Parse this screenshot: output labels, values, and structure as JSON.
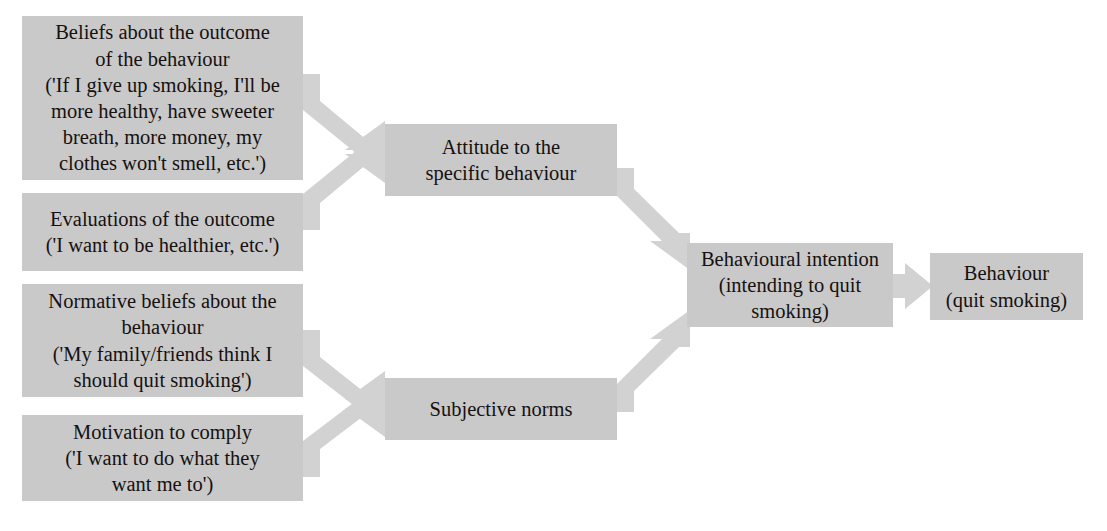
{
  "diagram": {
    "type": "flow-diagram",
    "colors": {
      "box_fill": "#c9c9c9",
      "arrow_fill": "#d2d2d2",
      "text": "#16110f",
      "background": "#ffffff"
    },
    "nodes": [
      {
        "id": "beliefs",
        "label": "Beliefs about the outcome\nof the behaviour\n('If I give up smoking, I'll be\nmore healthy, have sweeter\nbreath, more money, my\nclothes won't smell, etc.')"
      },
      {
        "id": "evaluations",
        "label": "Evaluations of the outcome\n('I want to be healthier, etc.')"
      },
      {
        "id": "normative",
        "label": "Normative beliefs about the\nbehaviour\n('My family/friends think I\nshould quit smoking')"
      },
      {
        "id": "motivation",
        "label": "Motivation to comply\n('I want to do what they\nwant me to')"
      },
      {
        "id": "attitude",
        "label": "Attitude to the\nspecific behaviour"
      },
      {
        "id": "subjective",
        "label": "Subjective norms"
      },
      {
        "id": "intention",
        "label": "Behavioural intention\n(intending to quit\nsmoking)"
      },
      {
        "id": "behaviour",
        "label": "Behaviour\n(quit smoking)"
      }
    ],
    "edges": [
      {
        "id": "beliefs-to-attitude",
        "from": "beliefs",
        "to": "attitude"
      },
      {
        "id": "evaluations-to-attitude",
        "from": "evaluations",
        "to": "attitude"
      },
      {
        "id": "normative-to-subjective",
        "from": "normative",
        "to": "subjective"
      },
      {
        "id": "motivation-to-subjective",
        "from": "motivation",
        "to": "subjective"
      },
      {
        "id": "attitude-to-intention",
        "from": "attitude",
        "to": "intention"
      },
      {
        "id": "subjective-to-intention",
        "from": "subjective",
        "to": "intention"
      },
      {
        "id": "intention-to-behaviour",
        "from": "intention",
        "to": "behaviour"
      }
    ]
  }
}
